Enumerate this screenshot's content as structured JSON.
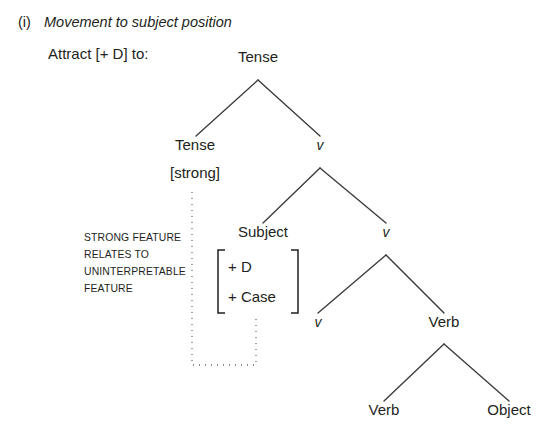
{
  "caption": {
    "enumerator": "(i)",
    "title": "Movement to subject position"
  },
  "instruction": {
    "text": "Attract [+ D] to:"
  },
  "tree": {
    "nodes": [
      {
        "id": "root-tense",
        "label": "Tense",
        "style": "roman",
        "x": 258,
        "y": 62
      },
      {
        "id": "tense-spec",
        "label": "Tense",
        "style": "roman",
        "x": 195,
        "y": 150
      },
      {
        "id": "tense-strong",
        "label": "[strong]",
        "style": "roman",
        "x": 195,
        "y": 178
      },
      {
        "id": "v-top",
        "label": "v",
        "style": "italic",
        "x": 320,
        "y": 150
      },
      {
        "id": "subject",
        "label": "Subject",
        "style": "roman",
        "x": 263,
        "y": 237
      },
      {
        "id": "v-mid",
        "label": "v",
        "style": "italic",
        "x": 386,
        "y": 237
      },
      {
        "id": "v-low",
        "label": "v",
        "style": "italic",
        "x": 318,
        "y": 327
      },
      {
        "id": "verb-upper",
        "label": "Verb",
        "style": "roman",
        "x": 444,
        "y": 327
      },
      {
        "id": "verb-lower",
        "label": "Verb",
        "style": "roman",
        "x": 384,
        "y": 415
      },
      {
        "id": "object",
        "label": "Object",
        "style": "roman",
        "x": 509,
        "y": 415
      }
    ],
    "branches": [
      {
        "id": "root-to-tense",
        "apex_x": 258,
        "apex_y": 80,
        "end_x": 196,
        "end_y": 136
      },
      {
        "id": "root-to-v-top",
        "apex_x": 258,
        "apex_y": 80,
        "end_x": 320,
        "end_y": 136
      },
      {
        "id": "v-top-to-subject",
        "apex_x": 320,
        "apex_y": 168,
        "end_x": 263,
        "end_y": 223
      },
      {
        "id": "v-top-to-v-mid",
        "apex_x": 320,
        "apex_y": 168,
        "end_x": 386,
        "end_y": 223
      },
      {
        "id": "v-mid-to-v-low",
        "apex_x": 386,
        "apex_y": 255,
        "end_x": 318,
        "end_y": 313
      },
      {
        "id": "v-mid-to-verb",
        "apex_x": 386,
        "apex_y": 255,
        "end_x": 444,
        "end_y": 313
      },
      {
        "id": "verb-to-verb",
        "apex_x": 444,
        "apex_y": 344,
        "end_x": 384,
        "end_y": 401
      },
      {
        "id": "verb-to-object",
        "apex_x": 444,
        "apex_y": 344,
        "end_x": 509,
        "end_y": 401
      }
    ],
    "feature_matrix": {
      "id": "subject-features",
      "rows": [
        "+ D",
        "+ Case"
      ],
      "left_x": 218,
      "right_x": 298,
      "top_y": 250,
      "bottom_y": 313,
      "text_x": 228,
      "row_y": [
        272,
        302
      ]
    },
    "annotation": {
      "lines": [
        "STRONG FEATURE",
        "RELATES TO",
        "UNINTERPRETABLE",
        "FEATURE"
      ],
      "x": 84,
      "line_y": [
        241,
        258,
        275,
        292
      ]
    },
    "dotted_link": {
      "id": "strong-to-case-link",
      "points": "192,192 192,365 256,365 256,315"
    }
  },
  "colors": {
    "background": "#ffffff",
    "text": "#231f20",
    "branch": "#3a3a3c",
    "dotted": "#404040"
  }
}
